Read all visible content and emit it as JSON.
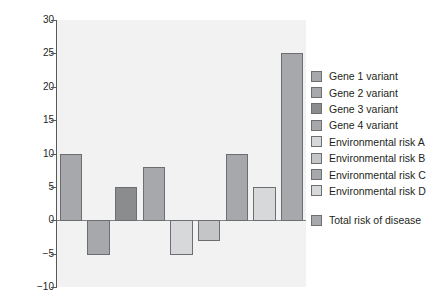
{
  "chart_data": {
    "type": "bar",
    "title": "",
    "xlabel": "",
    "ylabel": "Contribution to risk",
    "ylim": [
      -10,
      30
    ],
    "yticks": [
      30,
      25,
      20,
      15,
      10,
      5,
      0,
      -5,
      -10
    ],
    "ytick_labels": [
      "30",
      "25",
      "20",
      "15",
      "10",
      "5",
      "0",
      "−5",
      "−10"
    ],
    "grid": false,
    "legend_position": "right",
    "xtick_labels": [],
    "categories": [
      "Gene 1 variant",
      "Gene 2 variant",
      "Gene 3 variant",
      "Gene 4 variant",
      "Environmental risk A",
      "Environmental risk B",
      "Environmental risk C",
      "Environmental risk D",
      "Total risk of disease"
    ],
    "values": [
      10,
      -5,
      5,
      8,
      -5,
      -3,
      10,
      5,
      25
    ],
    "colors": [
      "#a6a8ab",
      "#a6a8ab",
      "#8a8c8e",
      "#a6a8ab",
      "#d7d8d9",
      "#c3c5c6",
      "#a6a8ab",
      "#d7d8d9",
      "#a6a8ab"
    ],
    "bar_edge_color": "#6d6e71",
    "plot_background": "#f2f2f2",
    "axis_color": "#58595b",
    "zero_line_color": "#808285"
  },
  "legend": {
    "items": [
      {
        "label": "Gene 1 variant",
        "color": "#a6a8ab",
        "spaced": false
      },
      {
        "label": "Gene 2 variant",
        "color": "#a6a8ab",
        "spaced": false
      },
      {
        "label": "Gene 3 variant",
        "color": "#8a8c8e",
        "spaced": false
      },
      {
        "label": "Gene 4 variant",
        "color": "#a6a8ab",
        "spaced": false
      },
      {
        "label": "Environmental risk A",
        "color": "#d7d8d9",
        "spaced": false
      },
      {
        "label": "Environmental risk B",
        "color": "#c3c5c6",
        "spaced": false
      },
      {
        "label": "Environmental risk C",
        "color": "#a6a8ab",
        "spaced": false
      },
      {
        "label": "Environmental risk D",
        "color": "#d7d8d9",
        "spaced": false
      },
      {
        "label": "Total risk of disease",
        "color": "#a6a8ab",
        "spaced": true
      }
    ]
  }
}
